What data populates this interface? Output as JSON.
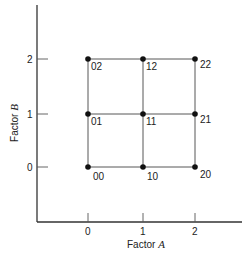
{
  "diagram": {
    "x_axis": {
      "label": "Factor",
      "label_var": "A",
      "ticks": [
        "0",
        "1",
        "2"
      ]
    },
    "y_axis": {
      "label": "Factor",
      "label_var": "B",
      "ticks": [
        "0",
        "1",
        "2"
      ]
    },
    "points": [
      {
        "a": 0,
        "b": 0,
        "label": "00"
      },
      {
        "a": 1,
        "b": 0,
        "label": "10"
      },
      {
        "a": 2,
        "b": 0,
        "label": "20"
      },
      {
        "a": 0,
        "b": 1,
        "label": "01"
      },
      {
        "a": 1,
        "b": 1,
        "label": "11"
      },
      {
        "a": 2,
        "b": 1,
        "label": "21"
      },
      {
        "a": 0,
        "b": 2,
        "label": "02"
      },
      {
        "a": 1,
        "b": 2,
        "label": "12"
      },
      {
        "a": 2,
        "b": 2,
        "label": "22"
      }
    ],
    "colors": {
      "line": "#333333",
      "point": "#111111",
      "text": "#222222"
    }
  }
}
